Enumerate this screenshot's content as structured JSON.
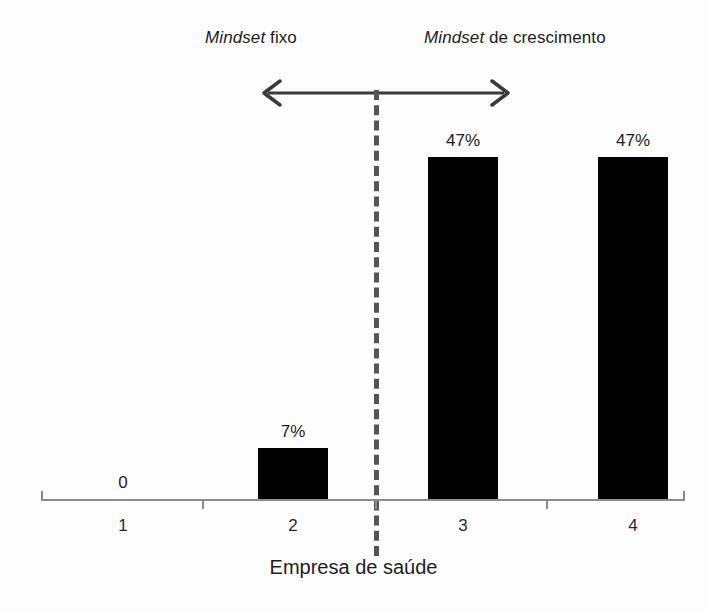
{
  "chart_data": {
    "type": "bar",
    "title": "",
    "subtitle": "",
    "xlabel": "Empresa de saúde",
    "ylabel": "",
    "categories": [
      "1",
      "2",
      "3",
      "4"
    ],
    "values": [
      0,
      7,
      47,
      47
    ],
    "value_labels": [
      "0",
      "7%",
      "47%",
      "47%"
    ],
    "ylim": [
      0,
      55
    ],
    "grid": false,
    "legend": "none",
    "bar_color": "#000000",
    "axis_color": "#8d8d8d",
    "annotations": [
      {
        "name": "fixed-mindset-region",
        "text_emphasis": "Mindset",
        "text_rest": " fixo",
        "full_text": "Mindset fixo"
      },
      {
        "name": "growth-mindset-region",
        "text_emphasis": "Mindset",
        "text_rest": " de crescimento",
        "full_text": "Mindset de crescimento"
      }
    ],
    "divider": {
      "name": "mindset-divider",
      "style": "dashed",
      "color": "#555555",
      "between_categories": [
        "2",
        "3"
      ]
    },
    "range_arrow": {
      "name": "double-headed-arrow",
      "direction": "both",
      "color": "#3a3a3a"
    }
  },
  "labels": {
    "fixed_mindset_em": "Mindset",
    "fixed_mindset_rest": " fixo",
    "growth_mindset_em": "Mindset",
    "growth_mindset_rest": " de crescimento",
    "axis_title": "Empresa de saúde",
    "value_0": "0",
    "value_1": "7%",
    "value_2": "47%",
    "value_3": "47%",
    "cat_0": "1",
    "cat_1": "2",
    "cat_2": "3",
    "cat_3": "4"
  }
}
